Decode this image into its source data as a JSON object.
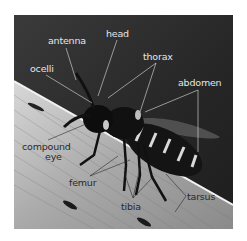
{
  "figure": {
    "background_color": "#ffffff",
    "photo_dark_color": "#2a2a2a",
    "label_light_color": "#e6e6e6",
    "label_dark_color": "#2a2a2a"
  },
  "labels": [
    {
      "id": "antenna",
      "text": "antenna",
      "x": 48,
      "y": 36,
      "tone": "light"
    },
    {
      "id": "head",
      "text": "head",
      "x": 106,
      "y": 29,
      "tone": "light"
    },
    {
      "id": "thorax",
      "text": "thorax",
      "x": 143,
      "y": 52,
      "tone": "light"
    },
    {
      "id": "ocelli",
      "text": "ocelli",
      "x": 30,
      "y": 64,
      "tone": "light"
    },
    {
      "id": "abdomen",
      "text": "abdomen",
      "x": 178,
      "y": 78,
      "tone": "light"
    },
    {
      "id": "compound-eye-line1",
      "text": "compound",
      "x": 22,
      "y": 142,
      "tone": "dark"
    },
    {
      "id": "compound-eye-line2",
      "text": "eye",
      "x": 45,
      "y": 152,
      "tone": "dark"
    },
    {
      "id": "femur",
      "text": "femur",
      "x": 69,
      "y": 178,
      "tone": "dark"
    },
    {
      "id": "tibia",
      "text": "tibia",
      "x": 121,
      "y": 202,
      "tone": "dark"
    },
    {
      "id": "tarsus",
      "text": "tarsus",
      "x": 187,
      "y": 192,
      "tone": "dark"
    }
  ]
}
